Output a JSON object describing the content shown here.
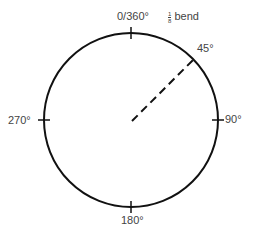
{
  "diagram": {
    "labels": {
      "top": "0/360°",
      "right": "90°",
      "bottom": "180°",
      "left": "270°",
      "diag": "45°"
    },
    "fraction": {
      "num": "1",
      "den": "8",
      "text": "bend"
    },
    "colors": {
      "stroke": "#111111",
      "text": "#444444"
    }
  }
}
